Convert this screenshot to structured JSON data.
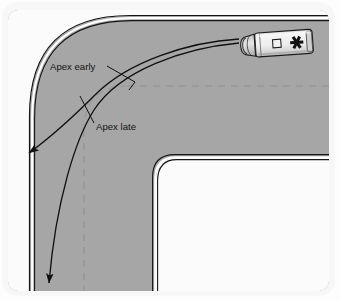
{
  "figure": {
    "alt": "Top-down view of a road corner with an ambulance and two cornering paths"
  },
  "labels": {
    "apex_early": "Apex early",
    "apex_late": "Apex late"
  },
  "vehicle": {
    "name": "ambulance",
    "symbol": "star-of-life",
    "window_name": "roof-hatch"
  },
  "colors": {
    "road": "#a8a8a8",
    "road_shade": "#9f9fa0",
    "inner_area": "#fbfbfb",
    "page": "#f7f7f8",
    "line": "#111111",
    "edge_white": "#ffffff",
    "center_dash": "#8e8e8e",
    "vehicle_body": "#e9e9e9",
    "vehicle_outline": "#1a1a1a"
  },
  "geometry": {
    "road_outer_radius": 96,
    "road_inner_radius": 22,
    "center_dash_pattern": "7 6"
  }
}
